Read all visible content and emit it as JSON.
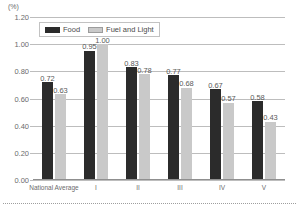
{
  "chart_data": {
    "type": "bar",
    "title": "",
    "subtitle": "",
    "unit_label": "(%)",
    "xlabel": "",
    "ylabel": "",
    "ylim": [
      0.0,
      1.2
    ],
    "ytick_labels": [
      "1.20",
      "1.00",
      "0.80",
      "0.60",
      "0.40",
      "0.20",
      "0.00"
    ],
    "ytick_values": [
      1.2,
      1.0,
      0.8,
      0.6,
      0.4,
      0.2,
      0.0
    ],
    "grid": true,
    "legend_position": "top-left-inside",
    "categories": [
      "National Average",
      "I",
      "II",
      "III",
      "IV",
      "V"
    ],
    "series": [
      {
        "name": "Food",
        "color": "#2b2b2b",
        "values": [
          0.72,
          0.95,
          0.83,
          0.77,
          0.67,
          0.58
        ],
        "labels": [
          "0.72",
          "0.95",
          "0.83",
          "0.77",
          "0.67",
          "0.58"
        ]
      },
      {
        "name": "Fuel and Light",
        "color": "#c9c9c9",
        "values": [
          0.63,
          1.0,
          0.78,
          0.68,
          0.57,
          0.43
        ],
        "labels": [
          "0.63",
          "1.00",
          "0.78",
          "0.68",
          "0.57",
          "0.43"
        ]
      }
    ]
  }
}
